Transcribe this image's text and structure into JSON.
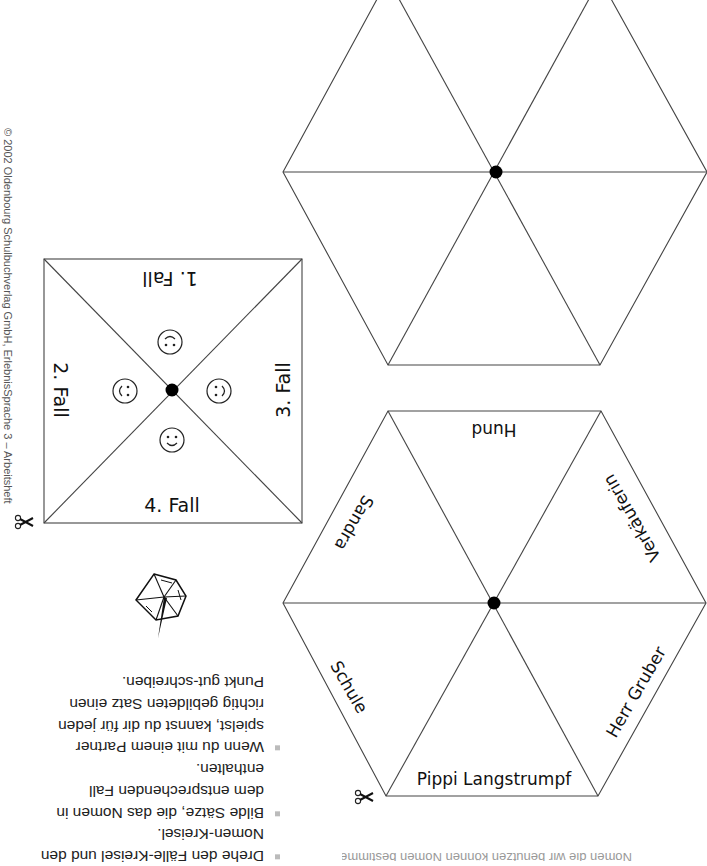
{
  "copyright": "© 2002 Oldenbourg Schulbuchverlag GmbH, ErlebnisSprache 3 – Arbeitsheft",
  "faelle_kreisel": {
    "segments": [
      {
        "label": "1. Fall",
        "face": "upside-down-smiley"
      },
      {
        "label": "2. Fall",
        "face": "rotated-smiley"
      },
      {
        "label": "3. Fall",
        "face": "rotated-smiley"
      },
      {
        "label": "4. Fall",
        "face": "smiley"
      }
    ]
  },
  "blank_kreisel": {
    "segments": [
      "",
      "",
      "",
      "",
      "",
      ""
    ]
  },
  "nomen_kreisel": {
    "segments": [
      "Hund",
      "Verkäuferin",
      "Herr Gruber",
      "Pippi Langstrumpf",
      "Schule",
      "Sandra"
    ]
  },
  "instructions": {
    "items": [
      "Drehe den Fälle-Kreisel und den Nomen-Kreisel.",
      "Bilde Sätze, die das Nomen in dem entsprechenden Fall enthalten.",
      "Wenn du mit einem Partner spielst, kannst du dir für jeden richtig gebildeten Satz einen Punkt gut-schreiben."
    ]
  },
  "icons": {
    "scissors": "scissors-icon",
    "spinning_top": "spinning-top-icon"
  },
  "caption": "Nomen die wir benutzen können Nomen bestimmen"
}
